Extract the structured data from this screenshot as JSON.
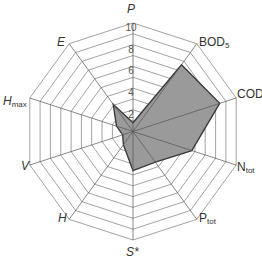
{
  "chart_data": {
    "type": "radar",
    "title": "",
    "axes": [
      {
        "key": "P",
        "label": "P",
        "sub": "",
        "italic": true
      },
      {
        "key": "BOD5",
        "label": "BOD",
        "sub": "5",
        "italic": false
      },
      {
        "key": "COD",
        "label": "COD",
        "sub": "",
        "italic": false
      },
      {
        "key": "Ntot",
        "label": "N",
        "sub": "tot",
        "italic": false
      },
      {
        "key": "Ptot",
        "label": "P",
        "sub": "tot",
        "italic": false
      },
      {
        "key": "S*",
        "label": "S*",
        "sub": "",
        "italic": true
      },
      {
        "key": "H",
        "label": "H",
        "sub": "",
        "italic": true
      },
      {
        "key": "V",
        "label": "V",
        "sub": "",
        "italic": true
      },
      {
        "key": "Hmax",
        "label": "H",
        "sub": "max",
        "italic": true
      },
      {
        "key": "E",
        "label": "E",
        "sub": "",
        "italic": true
      }
    ],
    "categories": [
      "P",
      "BOD5",
      "COD",
      "Ntot",
      "Ptot",
      "S*",
      "H",
      "V",
      "Hmax",
      "E"
    ],
    "series": [
      {
        "name": "profile",
        "values": [
          0.8,
          7.6,
          8.4,
          5.7,
          3.5,
          3.6,
          1.5,
          1.0,
          1.6,
          3.1
        ]
      }
    ],
    "range": [
      0,
      10
    ],
    "rings": 10,
    "tick_labels": [
      "2",
      "4",
      "6",
      "8",
      "10"
    ],
    "tick_values": [
      2,
      4,
      6,
      8,
      10
    ],
    "grid": true,
    "legend": "none",
    "colors": {
      "fill": "#9a9a9a",
      "outline": "#3a3a3a",
      "grid": "#8c8c8c",
      "spoke": "#555555"
    }
  }
}
